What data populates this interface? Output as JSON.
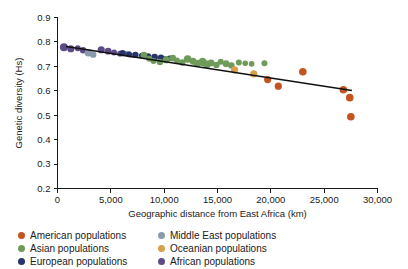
{
  "chart_data": {
    "type": "scatter",
    "title": "",
    "xlabel": "Geographic distance from East Africa (km)",
    "ylabel": "Genetic diversity (Hs)",
    "xlim": [
      0,
      30000
    ],
    "ylim": [
      0.2,
      0.9
    ],
    "xticks": [
      0,
      5000,
      10000,
      15000,
      20000,
      25000,
      30000
    ],
    "xticklabels": [
      "0",
      "5,000",
      "10,000",
      "15,000",
      "20,000",
      "25,000",
      "30,000"
    ],
    "yticks": [
      0.2,
      0.3,
      0.4,
      0.5,
      0.6,
      0.7,
      0.8,
      0.9
    ],
    "yticklabels": [
      "0.2",
      "0.3",
      "0.4",
      "0.5",
      "0.6",
      "0.7",
      "0.8",
      "0.9"
    ],
    "grid": false,
    "legend_position": "below-axes",
    "trend_line": {
      "label": "linear regression",
      "x": [
        800,
        27600
      ],
      "y": [
        0.781,
        0.601
      ],
      "color": "#111111"
    },
    "series": [
      {
        "name": "African populations",
        "color": "#5d4b87",
        "points": [
          {
            "x": 600,
            "y": 0.778,
            "r": 4.0
          },
          {
            "x": 1250,
            "y": 0.772,
            "r": 3.6
          },
          {
            "x": 1900,
            "y": 0.774,
            "r": 3.0
          },
          {
            "x": 2400,
            "y": 0.766,
            "r": 3.2
          },
          {
            "x": 4100,
            "y": 0.768,
            "r": 3.6
          },
          {
            "x": 4750,
            "y": 0.762,
            "r": 3.4
          },
          {
            "x": 5300,
            "y": 0.757,
            "r": 3.0
          },
          {
            "x": 5850,
            "y": 0.752,
            "r": 2.8
          }
        ]
      },
      {
        "name": "Middle East populations",
        "color": "#8a9bab",
        "points": [
          {
            "x": 2900,
            "y": 0.756,
            "r": 3.8
          },
          {
            "x": 3350,
            "y": 0.748,
            "r": 3.2
          },
          {
            "x": 6400,
            "y": 0.751,
            "r": 2.8
          },
          {
            "x": 6900,
            "y": 0.745,
            "r": 2.6
          }
        ]
      },
      {
        "name": "European populations",
        "color": "#27336b",
        "points": [
          {
            "x": 6100,
            "y": 0.754,
            "r": 3.2
          },
          {
            "x": 6700,
            "y": 0.75,
            "r": 3.0
          },
          {
            "x": 7300,
            "y": 0.747,
            "r": 3.2
          },
          {
            "x": 7900,
            "y": 0.744,
            "r": 2.8
          },
          {
            "x": 8500,
            "y": 0.741,
            "r": 3.0
          },
          {
            "x": 9100,
            "y": 0.738,
            "r": 3.4
          },
          {
            "x": 9700,
            "y": 0.735,
            "r": 3.2
          },
          {
            "x": 10100,
            "y": 0.729,
            "r": 3.0
          },
          {
            "x": 10500,
            "y": 0.733,
            "r": 2.8
          }
        ]
      },
      {
        "name": "Asian populations",
        "color": "#6e9a5a",
        "points": [
          {
            "x": 8100,
            "y": 0.746,
            "r": 3.4
          },
          {
            "x": 8600,
            "y": 0.731,
            "r": 3.0
          },
          {
            "x": 9000,
            "y": 0.722,
            "r": 3.0
          },
          {
            "x": 9600,
            "y": 0.718,
            "r": 3.2
          },
          {
            "x": 10200,
            "y": 0.727,
            "r": 3.6
          },
          {
            "x": 10800,
            "y": 0.734,
            "r": 3.4
          },
          {
            "x": 11200,
            "y": 0.724,
            "r": 3.0
          },
          {
            "x": 11700,
            "y": 0.716,
            "r": 3.2
          },
          {
            "x": 12200,
            "y": 0.73,
            "r": 3.8
          },
          {
            "x": 12700,
            "y": 0.721,
            "r": 3.4
          },
          {
            "x": 13100,
            "y": 0.712,
            "r": 3.6
          },
          {
            "x": 13600,
            "y": 0.718,
            "r": 4.2
          },
          {
            "x": 14000,
            "y": 0.708,
            "r": 3.8
          },
          {
            "x": 14400,
            "y": 0.714,
            "r": 3.4
          },
          {
            "x": 14900,
            "y": 0.706,
            "r": 3.2
          },
          {
            "x": 15300,
            "y": 0.719,
            "r": 3.0
          },
          {
            "x": 15800,
            "y": 0.711,
            "r": 3.4
          },
          {
            "x": 16300,
            "y": 0.704,
            "r": 3.2
          },
          {
            "x": 17000,
            "y": 0.716,
            "r": 3.0
          },
          {
            "x": 17600,
            "y": 0.713,
            "r": 2.8
          },
          {
            "x": 18200,
            "y": 0.71,
            "r": 2.8
          },
          {
            "x": 19400,
            "y": 0.713,
            "r": 3.0
          }
        ]
      },
      {
        "name": "Oceanian populations",
        "color": "#d9a04a",
        "points": [
          {
            "x": 16600,
            "y": 0.686,
            "r": 3.6
          },
          {
            "x": 18400,
            "y": 0.669,
            "r": 3.6
          }
        ]
      },
      {
        "name": "American populations",
        "color": "#c4541f",
        "points": [
          {
            "x": 19700,
            "y": 0.646,
            "r": 3.6
          },
          {
            "x": 20700,
            "y": 0.619,
            "r": 3.6
          },
          {
            "x": 23000,
            "y": 0.678,
            "r": 3.8
          },
          {
            "x": 26800,
            "y": 0.604,
            "r": 3.8
          },
          {
            "x": 27400,
            "y": 0.572,
            "r": 3.8
          },
          {
            "x": 27500,
            "y": 0.494,
            "r": 3.8
          }
        ]
      }
    ]
  },
  "axes": {
    "y_title": "Genetic diversity (Hs)",
    "x_title": "Geographic distance from East Africa (km)"
  },
  "legend": {
    "items": [
      {
        "label": "American populations",
        "color": "#c4541f"
      },
      {
        "label": "Middle East populations",
        "color": "#8a9bab"
      },
      {
        "label": "Asian populations",
        "color": "#6e9a5a"
      },
      {
        "label": "Oceanian populations",
        "color": "#d9a04a"
      },
      {
        "label": "European populations",
        "color": "#27336b"
      },
      {
        "label": "African populations",
        "color": "#5d4b87"
      }
    ]
  }
}
